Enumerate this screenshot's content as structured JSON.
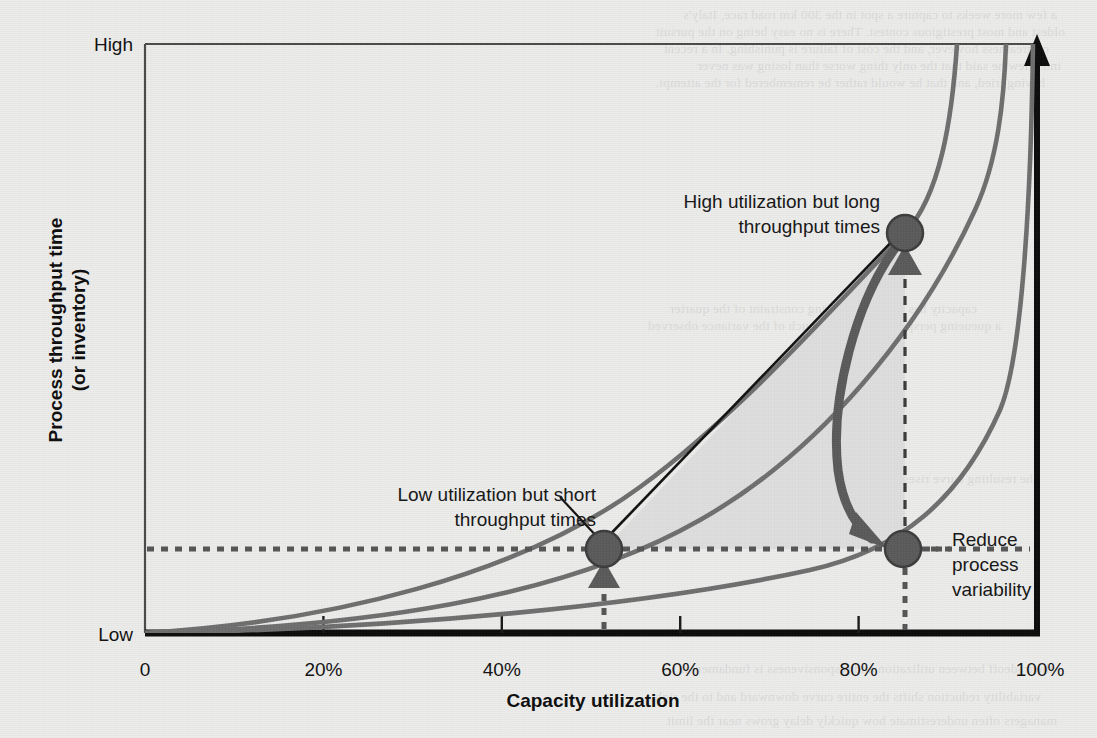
{
  "figure": {
    "background_color": "#ececeb",
    "plot_border_color": "#4a4a4a",
    "axis_color": "#000000",
    "curve_color": "#6e6e6e",
    "marker_fill": "#5a5a5a",
    "marker_stroke": "#3c3c3c",
    "shade_fill": "#dedede",
    "dotted_color": "#555555"
  },
  "axes": {
    "y_label": "Process throughput time",
    "y_label_line2": "(or inventory)",
    "y_high": "High",
    "y_low": "Low",
    "x_label": "Capacity utilization",
    "x_ticks": [
      "0",
      "20%",
      "40%",
      "60%",
      "80%",
      "100%"
    ]
  },
  "callouts": {
    "high_util": {
      "line1": "High utilization but long",
      "line2": "throughput times"
    },
    "low_util": {
      "line1": "Low utilization but short",
      "line2": "throughput times"
    },
    "reduce": {
      "line1": "Reduce",
      "line2": "process",
      "line3": "variability"
    }
  },
  "bleed_through": [
    {
      "top": 6,
      "left": 40,
      "text": "a few more weeks to capture a spot in the 300 km road race, Italy's"
    },
    {
      "top": 23,
      "left": 32,
      "text": "oldest and most prestigious contest. There is no easy being on the pursuit"
    },
    {
      "top": 40,
      "left": 48,
      "text": "of greatness however, and the cost of failure is punishing. In a recent"
    },
    {
      "top": 57,
      "left": 36,
      "text": "interview he said that the only thing worse than losing was never"
    },
    {
      "top": 74,
      "left": 52,
      "text": "having tried, and that he would rather be remembered for the attempt."
    },
    {
      "top": 300,
      "left": 120,
      "text": "capacity has been the defining constraint of the quarter"
    },
    {
      "top": 317,
      "left": 96,
      "text": "a queueing perspective explains much of the variance observed"
    },
    {
      "top": 470,
      "left": 60,
      "text": "the resulting curve rises sharply as utilization approaches unity"
    },
    {
      "top": 660,
      "left": 44,
      "text": "the tradeoff between utilization and responsiveness is fundamental"
    },
    {
      "top": 688,
      "left": 56,
      "text": "variability reduction shifts the entire curve downward and to the right"
    },
    {
      "top": 712,
      "left": 40,
      "text": "managers often underestimate how quickly delay grows near the limit"
    }
  ],
  "chart_data": {
    "type": "line",
    "title": "",
    "xlabel": "Capacity utilization",
    "ylabel": "Process throughput time (or inventory)",
    "xlim": [
      0,
      100
    ],
    "ylim": [
      0,
      100
    ],
    "x_tick_values": [
      0,
      20,
      40,
      60,
      80,
      100
    ],
    "x_tick_labels": [
      "0",
      "20%",
      "40%",
      "60%",
      "80%",
      "100%"
    ],
    "y_tick_labels": [
      "Low",
      "High"
    ],
    "grid": false,
    "legend": "none",
    "series": [
      {
        "name": "High variability process",
        "description": "Steepest queueing curve; reaches High at about 91% utilization",
        "x": [
          0,
          10,
          20,
          30,
          40,
          50,
          60,
          70,
          78,
          84,
          88,
          91
        ],
        "y": [
          0,
          3,
          7,
          12,
          19,
          29,
          41,
          56,
          70,
          82,
          92,
          100
        ]
      },
      {
        "name": "Medium variability process",
        "description": "Middle queueing curve; reaches High at about 95% utilization",
        "x": [
          0,
          10,
          20,
          30,
          40,
          50,
          60,
          70,
          80,
          88,
          92,
          95
        ],
        "y": [
          0,
          2,
          5,
          9,
          14,
          21,
          30,
          43,
          60,
          78,
          90,
          100
        ]
      },
      {
        "name": "Low variability process",
        "description": "Flattest queueing curve; reaches High at about 99% utilization",
        "x": [
          0,
          10,
          20,
          30,
          40,
          50,
          60,
          70,
          80,
          88,
          94,
          97,
          99
        ],
        "y": [
          0,
          1,
          3,
          5,
          8,
          12,
          17,
          24,
          34,
          50,
          70,
          87,
          100
        ]
      }
    ],
    "points": [
      {
        "name": "Low utilization but short throughput times",
        "x": 51,
        "y": 14,
        "label": "Low utilization but short throughput times"
      },
      {
        "name": "High utilization but long throughput times",
        "x": 84,
        "y": 68,
        "label": "High utilization but long throughput times"
      },
      {
        "name": "Reduce process variability",
        "x": 84,
        "y": 14,
        "label": "Reduce process variability"
      }
    ],
    "annotations": [
      {
        "type": "arrow",
        "name": "variability-reduction-arrow",
        "from": [
          84,
          68
        ],
        "to": [
          84,
          14
        ],
        "note": "Thick curved arrow showing effect of reducing process variability"
      },
      {
        "type": "shaded-region",
        "name": "operating-region",
        "note": "Shaded area bounded by the straight tradeoff line, the horizontal reference at y=14 and the vertical reference at x=84"
      },
      {
        "type": "reference-line",
        "name": "horizontal-reference",
        "y": 14,
        "style": "dotted"
      },
      {
        "type": "reference-line",
        "name": "vertical-reference-low",
        "x": 51,
        "style": "dotted"
      },
      {
        "type": "reference-line",
        "name": "vertical-reference-high",
        "x": 84,
        "style": "dashed"
      }
    ]
  }
}
